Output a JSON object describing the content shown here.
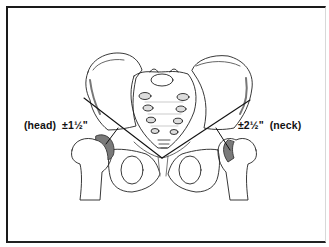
{
  "figure": {
    "labels": {
      "left": {
        "name": "(head)",
        "measurement": "±1½\""
      },
      "right": {
        "measurement": "±2½\"",
        "name": "(neck)"
      }
    },
    "colors": {
      "line": "#111111",
      "shade": "#7a7a7a",
      "border": "#1a1a1a",
      "background": "#ffffff"
    }
  }
}
